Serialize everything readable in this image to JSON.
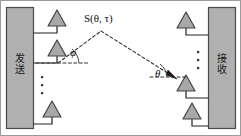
{
  "figure": {
    "type": "diagram",
    "width": 241,
    "height": 136,
    "border_color": "#9b9b9b",
    "block_fill": "#b0b0b0",
    "block_stroke": "#4a4a4a",
    "antenna_fill": "#a8a8a8",
    "antenna_stroke": "#444444",
    "line_color": "#222222",
    "dash_color": "#333333"
  },
  "blocks": {
    "transmit": {
      "label": "发送",
      "char1": "发",
      "char2": "送"
    },
    "receive": {
      "label": "接收",
      "char1": "接",
      "char2": "收"
    }
  },
  "labels": {
    "source": "S(θ, τ)",
    "source_prefix": "S",
    "source_args": "(θ, τ)",
    "departure_angle": "φ",
    "arrival_angle": "θ"
  },
  "antennas": {
    "transmit_count_shown": 3,
    "receive_count_shown": 3,
    "ellipsis": "⋮"
  },
  "path": {
    "description": "dashed ray from transmit antenna to scatterer to receive antenna",
    "departure_reference": "horizontal dashed baseline at transmit side",
    "arrival_reference": "horizontal dashed baseline at receive side",
    "arrow_at": "receive antenna"
  }
}
